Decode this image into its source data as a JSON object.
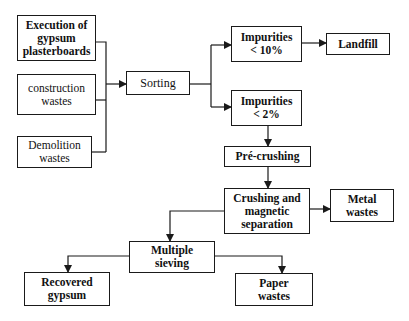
{
  "diagram": {
    "type": "flowchart",
    "nodes": [
      {
        "id": "execution",
        "label": "Execution of gypsum plasterboards",
        "lines": [
          "Execution of",
          "gypsum",
          "plasterboards"
        ]
      },
      {
        "id": "construction",
        "label": "construction wastes",
        "lines": [
          "construction",
          "wastes"
        ]
      },
      {
        "id": "demolition",
        "label": "Demolition wastes",
        "lines": [
          "Demolition",
          "wastes"
        ]
      },
      {
        "id": "sorting",
        "label": "Sorting",
        "lines": [
          "Sorting"
        ]
      },
      {
        "id": "imp10",
        "label": "Impurities < 10%",
        "lines": [
          "Impurities",
          "< 10%"
        ]
      },
      {
        "id": "landfill",
        "label": "Landfill",
        "lines": [
          "Landfill"
        ]
      },
      {
        "id": "imp2",
        "label": "Impurities < 2%",
        "lines": [
          "Impurities",
          "< 2%"
        ]
      },
      {
        "id": "precrushing",
        "label": "Pré-crushing",
        "lines": [
          "Pré-crushing"
        ]
      },
      {
        "id": "crushing",
        "label": "Crushing and magnetic separation",
        "lines": [
          "Crushing and",
          "magnetic",
          "separation"
        ]
      },
      {
        "id": "metal",
        "label": "Metal wastes",
        "lines": [
          "Metal",
          "wastes"
        ]
      },
      {
        "id": "sieving",
        "label": "Multiple sieving",
        "lines": [
          "Multiple",
          "sieving"
        ]
      },
      {
        "id": "gypsum",
        "label": "Recovered gypsum",
        "lines": [
          "Recovered",
          "gypsum"
        ]
      },
      {
        "id": "paper",
        "label": "Paper wastes",
        "lines": [
          "Paper",
          "wastes"
        ]
      }
    ],
    "edges": [
      {
        "from": "execution",
        "to": "sorting"
      },
      {
        "from": "construction",
        "to": "sorting"
      },
      {
        "from": "demolition",
        "to": "sorting"
      },
      {
        "from": "sorting",
        "to": "imp10"
      },
      {
        "from": "sorting",
        "to": "imp2"
      },
      {
        "from": "imp10",
        "to": "landfill"
      },
      {
        "from": "imp2",
        "to": "precrushing"
      },
      {
        "from": "precrushing",
        "to": "crushing"
      },
      {
        "from": "crushing",
        "to": "metal"
      },
      {
        "from": "crushing",
        "to": "sieving"
      },
      {
        "from": "sieving",
        "to": "gypsum"
      },
      {
        "from": "sieving",
        "to": "paper"
      }
    ]
  }
}
